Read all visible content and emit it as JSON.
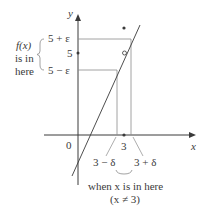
{
  "axes": {
    "x_label": "x",
    "y_label": "y",
    "origin_label": "0"
  },
  "y_ticks": {
    "upper": "5 + ε",
    "center": "5",
    "lower": "5 − ε"
  },
  "x_ticks": {
    "center": "3",
    "left": "3 − δ",
    "right": "3 + δ"
  },
  "left_annotation": {
    "line1": "f(x)",
    "line2": "is in",
    "line3": "here"
  },
  "bottom_annotation": {
    "line1": "when x is in here",
    "line2": "(x ≠ 3)"
  },
  "colors": {
    "ink": "#3a3a3a",
    "guide": "#8a8a8a"
  }
}
